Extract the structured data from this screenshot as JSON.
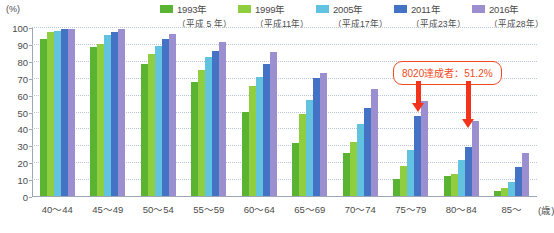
{
  "axis": {
    "unit_label": "(%)",
    "x_unit_label": "(歳)",
    "yticks": [
      0,
      10,
      20,
      30,
      40,
      50,
      60,
      70,
      80,
      90,
      100
    ]
  },
  "legend": {
    "items": [
      {
        "year": "1993年",
        "era": "（平成 5 年）",
        "color": "#5bb431"
      },
      {
        "year": "1999年",
        "era": "（平成11年）",
        "color": "#8fcf3f"
      },
      {
        "year": "2005年",
        "era": "（平成17年）",
        "color": "#62c3e0"
      },
      {
        "year": "2011年",
        "era": "（平成23年）",
        "color": "#4472c4"
      },
      {
        "year": "2016年",
        "era": "（平成28年）",
        "color": "#9b8fcf"
      }
    ]
  },
  "annotation": {
    "text": "8020達成者：51.2%",
    "color": "#f04a23"
  },
  "chart_data": {
    "type": "bar",
    "title": "",
    "xlabel": "(歳)",
    "ylabel": "(%)",
    "ylim": [
      0,
      100
    ],
    "grid": true,
    "legend_position": "top-right",
    "categories": [
      "40〜44",
      "45〜49",
      "50〜54",
      "55〜59",
      "60〜64",
      "65〜69",
      "70〜74",
      "75〜79",
      "80〜84",
      "85〜"
    ],
    "series": [
      {
        "name": "1993年（平成 5 年）",
        "color": "#5bb431",
        "values": [
          92.9,
          88.1,
          77.9,
          67.5,
          49.9,
          31.4,
          25.5,
          10.0,
          11.7,
          2.8
        ]
      },
      {
        "name": "1999年（平成11年）",
        "color": "#8fcf3f",
        "values": [
          97.1,
          90.0,
          84.3,
          74.6,
          64.9,
          48.8,
          31.9,
          17.5,
          13.0,
          4.5
        ]
      },
      {
        "name": "2005年（平成17年）",
        "color": "#62c3e0",
        "values": [
          97.8,
          95.0,
          88.9,
          82.3,
          70.3,
          57.1,
          42.9,
          27.1,
          21.1,
          8.3
        ]
      },
      {
        "name": "2011年（平成23年）",
        "color": "#4472c4",
        "values": [
          98.7,
          97.1,
          93.0,
          85.7,
          78.4,
          69.6,
          52.3,
          47.6,
          28.9,
          17.0
        ]
      },
      {
        "name": "2016年（平成28年）",
        "color": "#9b8fcf",
        "values": [
          98.8,
          99.0,
          95.9,
          91.3,
          85.2,
          73.0,
          63.4,
          56.1,
          44.2,
          25.7
        ]
      }
    ]
  }
}
